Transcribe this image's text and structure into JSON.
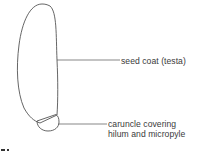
{
  "figure": {
    "type": "botanical-diagram",
    "stroke_color": "#555555",
    "text_color": "#3a3a3a",
    "background": "#ffffff"
  },
  "labels": {
    "seed_coat": {
      "text": "seed coat (testa)"
    },
    "caruncle": {
      "line1": "caruncle covering",
      "line2": "hilum and micropyle"
    }
  }
}
